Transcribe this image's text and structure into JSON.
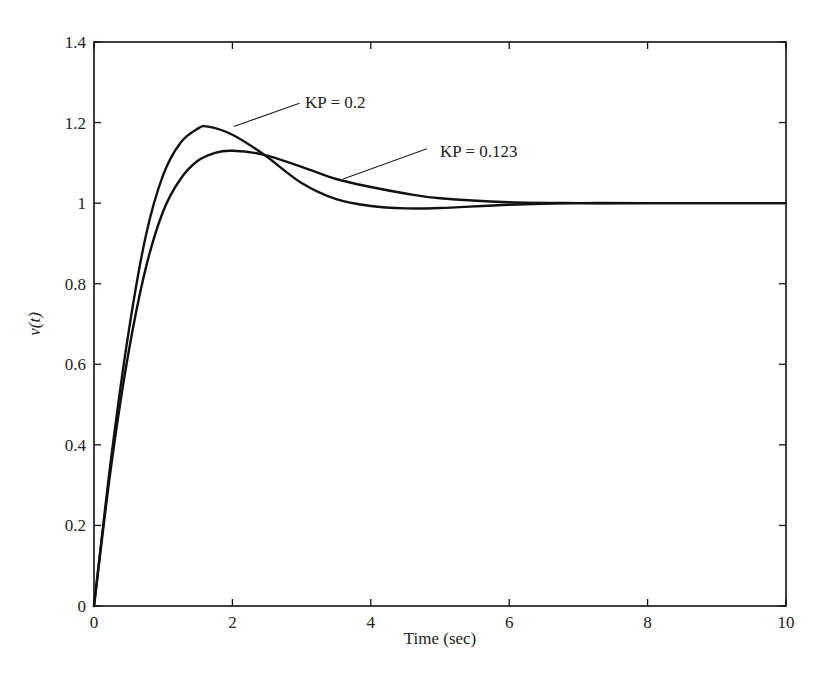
{
  "chart_data": {
    "type": "line",
    "title": "",
    "xlabel": "Time (sec)",
    "ylabel": "v(t)",
    "xlim": [
      0,
      10
    ],
    "ylim": [
      0,
      1.4
    ],
    "grid": false,
    "legend": "none (inline annotations)",
    "xticks": [
      0,
      2,
      4,
      6,
      8,
      10
    ],
    "xtick_labels": [
      "0",
      "2",
      "4",
      "6",
      "8",
      "10"
    ],
    "yticks": [
      0,
      0.2,
      0.4,
      0.6,
      0.8,
      1.0,
      1.2,
      1.4
    ],
    "ytick_labels": [
      "0",
      "0.2",
      "0.4",
      "0.6",
      "0.8",
      "1",
      "1.2",
      "1.4"
    ],
    "series": [
      {
        "name": "KP = 0.2",
        "x": [
          0,
          0.25,
          0.5,
          0.75,
          1.0,
          1.25,
          1.5,
          1.65,
          2.0,
          2.46,
          3.0,
          3.5,
          4.0,
          4.5,
          5.0,
          6.0,
          7.0,
          8.0,
          10.0
        ],
        "y": [
          0,
          0.37,
          0.68,
          0.92,
          1.07,
          1.15,
          1.185,
          1.19,
          1.17,
          1.12,
          1.05,
          1.01,
          0.993,
          0.987,
          0.988,
          0.996,
          1.0,
          1.0,
          1.0
        ]
      },
      {
        "name": "KP = 0.123",
        "x": [
          0,
          0.25,
          0.5,
          0.75,
          1.0,
          1.25,
          1.5,
          1.75,
          2.0,
          2.46,
          3.0,
          3.5,
          4.0,
          4.5,
          5.0,
          6.0,
          7.0,
          8.0,
          10.0
        ],
        "y": [
          0,
          0.35,
          0.63,
          0.84,
          0.98,
          1.06,
          1.105,
          1.125,
          1.13,
          1.12,
          1.09,
          1.06,
          1.04,
          1.024,
          1.012,
          1.002,
          1.0,
          1.0,
          1.0
        ]
      }
    ],
    "annotations": [
      {
        "text": "KP = 0.2",
        "points_to": {
          "x": 2.02,
          "y": 1.19
        },
        "label_at": {
          "x": 3.05,
          "y": 1.25
        }
      },
      {
        "text": "KP = 0.123",
        "points_to": {
          "x": 3.6,
          "y": 1.06
        },
        "label_at": {
          "x": 5.0,
          "y": 1.13
        }
      }
    ]
  },
  "labels": {
    "xlabel": "Time (sec)",
    "ylabel": "v(t)",
    "annot1": "KP = 0.2",
    "annot2": "KP = 0.123"
  }
}
